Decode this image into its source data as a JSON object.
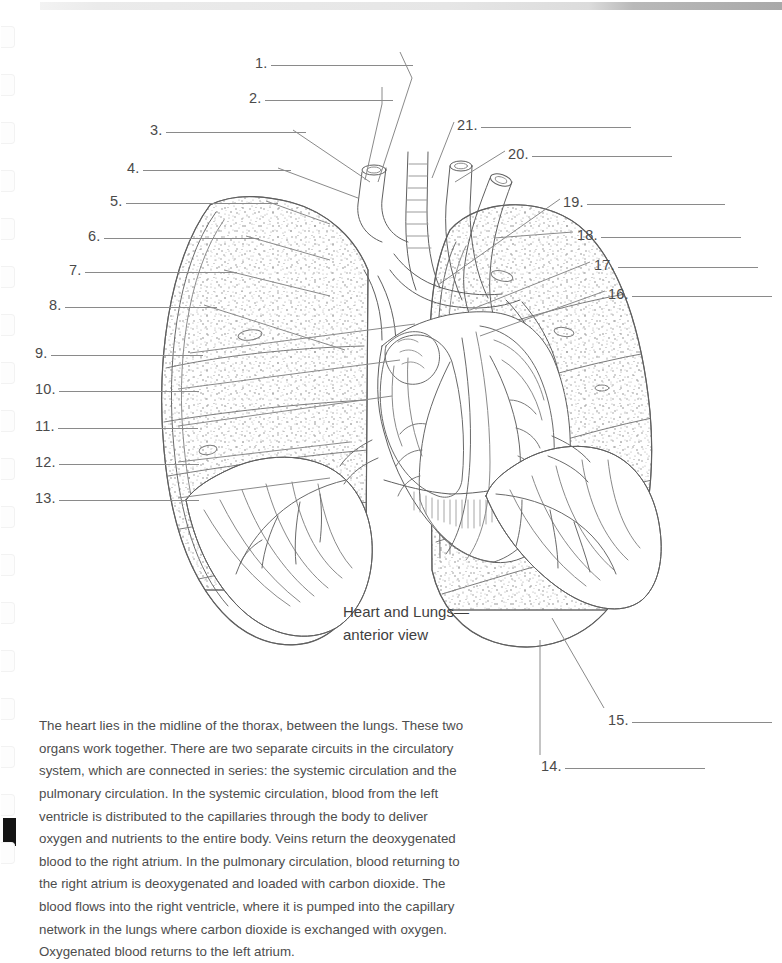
{
  "page": {
    "kind": "anatomy-worksheet-page",
    "background_color": "#ffffff",
    "scrollbar": {
      "name": "top-scrollbar",
      "track_color": "#e6e6e6",
      "thumb_color": "#a9a9a9"
    },
    "binding": {
      "hole_count": 18,
      "first_hole_y": 26,
      "spacing": 48,
      "mark_color": "#141414"
    }
  },
  "figure": {
    "caption_line1": "Heart and Lungs—",
    "caption_line2": "anterior view",
    "alt": "Line drawing of the heart and both lungs, anterior view, with 21 numbered leader lines pointing to unlabeled structures.",
    "ink_color": "#6d6d6d"
  },
  "labels": {
    "rule_color": "#8a8a8a",
    "left": [
      {
        "number": "1.",
        "x": 255,
        "y": 54,
        "rule_width": 142,
        "leader": "1-leader"
      },
      {
        "number": "2.",
        "x": 249,
        "y": 89,
        "rule_width": 128,
        "leader": "2-leader"
      },
      {
        "number": "3.",
        "x": 150,
        "y": 121,
        "rule_width": 140,
        "leader": "3-leader"
      },
      {
        "number": "4.",
        "x": 127,
        "y": 159,
        "rule_width": 148,
        "leader": "4-leader"
      },
      {
        "number": "5.",
        "x": 110,
        "y": 192,
        "rule_width": 152,
        "leader": "5-leader"
      },
      {
        "number": "6.",
        "x": 88,
        "y": 227,
        "rule_width": 155,
        "leader": "6-leader"
      },
      {
        "number": "7.",
        "x": 69,
        "y": 261,
        "rule_width": 152,
        "leader": "7-leader"
      },
      {
        "number": "8.",
        "x": 49,
        "y": 296,
        "rule_width": 152,
        "leader": "8-leader"
      },
      {
        "number": "9.",
        "x": 35,
        "y": 344,
        "rule_width": 152,
        "leader": "9-leader"
      },
      {
        "number": "10.",
        "x": 35,
        "y": 380,
        "rule_width": 140,
        "leader": "10-leader"
      },
      {
        "number": "11.",
        "x": 35,
        "y": 417,
        "rule_width": 140,
        "leader": "11-leader"
      },
      {
        "number": "12.",
        "x": 35,
        "y": 453,
        "rule_width": 140,
        "leader": "12-leader"
      },
      {
        "number": "13.",
        "x": 35,
        "y": 489,
        "rule_width": 140,
        "leader": "13-leader"
      }
    ],
    "right": [
      {
        "number": "21.",
        "x": 457,
        "y": 116,
        "rule_width": 150,
        "leader": "21-leader"
      },
      {
        "number": "20.",
        "x": 508,
        "y": 145,
        "rule_width": 140,
        "leader": "20-leader"
      },
      {
        "number": "19.",
        "x": 563,
        "y": 193,
        "rule_width": 138,
        "leader": "19-leader"
      },
      {
        "number": "18.",
        "x": 577,
        "y": 226,
        "rule_width": 140,
        "leader": "18-leader"
      },
      {
        "number": "17.",
        "x": 594,
        "y": 256,
        "rule_width": 140,
        "leader": "17-leader"
      },
      {
        "number": "16.",
        "x": 608,
        "y": 285,
        "rule_width": 140,
        "leader": "16-leader"
      },
      {
        "number": "15.",
        "x": 608,
        "y": 711,
        "rule_width": 140,
        "leader": "15-leader"
      },
      {
        "number": "14.",
        "x": 541,
        "y": 757,
        "rule_width": 140,
        "leader": "14-leader"
      }
    ]
  },
  "body": {
    "paragraph": "The heart lies in the midline of the thorax, between the lungs. These two organs work together. There are two separate circuits in the circulatory system, which are connected in series: the systemic circulation and the pulmonary circulation. In the systemic circulation, blood from the left ventricle is distributed to the capillaries through the body to deliver oxygen and nutrients to the entire body. Veins return the deoxygenated blood to the right atrium. In the pulmonary circulation, blood returning to the right atrium is deoxygenated and loaded with carbon dioxide. The blood flows into the right ventricle, where it is pumped into the capillary network in the lungs where carbon dioxide is exchanged with oxygen. Oxygenated blood returns to the left atrium."
  }
}
